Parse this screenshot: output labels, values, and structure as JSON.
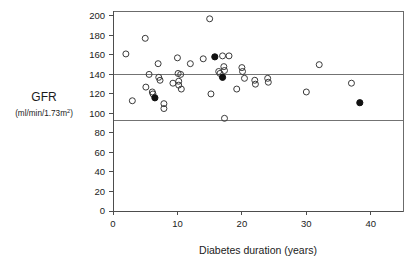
{
  "chart_data": {
    "type": "scatter",
    "title": "",
    "xlabel": "Diabetes duration (years)",
    "ylabel": "GFR",
    "ylabel_units": "(ml/min/1.73m",
    "ylabel_units_sup": "2",
    "ylabel_units_close": ")",
    "xlim": [
      0,
      45
    ],
    "ylim": [
      0,
      205
    ],
    "xticks": [
      0,
      10,
      20,
      30,
      40
    ],
    "xtick_labels": [
      "0",
      "10",
      "20",
      "30",
      "40"
    ],
    "yticks": [
      0,
      20,
      40,
      60,
      80,
      100,
      120,
      140,
      160,
      180,
      200
    ],
    "ytick_labels": [
      "0",
      "20",
      "40",
      "60",
      "80",
      "100",
      "120",
      "140",
      "160",
      "180",
      "200"
    ],
    "grid": false,
    "legend": "none",
    "reference_lines": [
      {
        "name": "upper-reference-line",
        "y": 140,
        "orientation": "horizontal"
      },
      {
        "name": "lower-reference-line",
        "y": 93,
        "orientation": "horizontal"
      }
    ],
    "series": [
      {
        "name": "open-circles",
        "marker": "open-circle",
        "color": "#3a3a3a",
        "points": [
          [
            2.0,
            161
          ],
          [
            3.0,
            113
          ],
          [
            5.0,
            177
          ],
          [
            5.1,
            127
          ],
          [
            5.6,
            140
          ],
          [
            6.1,
            122
          ],
          [
            6.2,
            120
          ],
          [
            7.0,
            151
          ],
          [
            7.1,
            137
          ],
          [
            7.3,
            134
          ],
          [
            7.9,
            110
          ],
          [
            7.9,
            105
          ],
          [
            9.3,
            131
          ],
          [
            10.0,
            157
          ],
          [
            10.1,
            141
          ],
          [
            10.2,
            133
          ],
          [
            10.2,
            129
          ],
          [
            10.5,
            140
          ],
          [
            10.6,
            125
          ],
          [
            12.0,
            151
          ],
          [
            14.0,
            156
          ],
          [
            15.0,
            197
          ],
          [
            15.2,
            120
          ],
          [
            16.4,
            143
          ],
          [
            16.6,
            141
          ],
          [
            17.0,
            159
          ],
          [
            17.2,
            148
          ],
          [
            17.3,
            144
          ],
          [
            17.3,
            95
          ],
          [
            18.0,
            159
          ],
          [
            19.2,
            125
          ],
          [
            20.0,
            147
          ],
          [
            20.1,
            143
          ],
          [
            20.4,
            136
          ],
          [
            22.0,
            134
          ],
          [
            22.1,
            130
          ],
          [
            24.0,
            136
          ],
          [
            24.1,
            132
          ],
          [
            30.0,
            122
          ],
          [
            32.0,
            150
          ],
          [
            37.0,
            131
          ]
        ]
      },
      {
        "name": "filled-circles",
        "marker": "filled-circle",
        "color": "#111111",
        "points": [
          [
            6.5,
            116
          ],
          [
            15.8,
            158
          ],
          [
            17.0,
            137
          ],
          [
            38.3,
            111
          ]
        ]
      }
    ]
  }
}
